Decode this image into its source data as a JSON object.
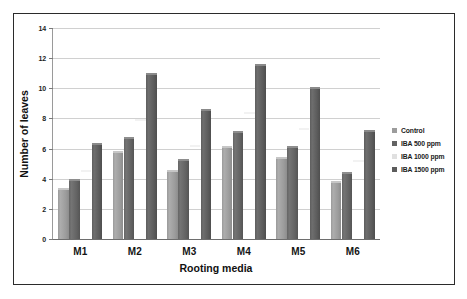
{
  "chart_data": {
    "type": "bar",
    "title": "",
    "xlabel": "Rooting media",
    "ylabel": "Number of leaves",
    "categories": [
      "M1",
      "M2",
      "M3",
      "M4",
      "M5",
      "M6"
    ],
    "ylim": [
      0,
      14
    ],
    "yticks": [
      0,
      2,
      4,
      6,
      8,
      10,
      12,
      14
    ],
    "ytick_labels": [
      "0",
      "2",
      "4",
      "6",
      "8",
      "10",
      "12",
      "14"
    ],
    "grid": true,
    "legend_position": "right",
    "series": [
      {
        "name": "Control",
        "color": "#9c9c9c",
        "values": [
          3.4,
          5.85,
          4.6,
          6.2,
          5.45,
          3.85
        ]
      },
      {
        "name": "IBA 500 ppm",
        "color": "#636363",
        "values": [
          4.0,
          6.75,
          5.3,
          7.2,
          6.2,
          4.45
        ]
      },
      {
        "name": "IBA 1000 ppm",
        "color": "#e0e0e0",
        "values": [
          4.6,
          7.95,
          6.25,
          8.4,
          7.35,
          5.25
        ]
      },
      {
        "name": "IBA 1500 ppm",
        "color": "#5c5c5c",
        "values": [
          6.4,
          11.0,
          8.65,
          11.6,
          10.1,
          7.25
        ]
      }
    ]
  }
}
